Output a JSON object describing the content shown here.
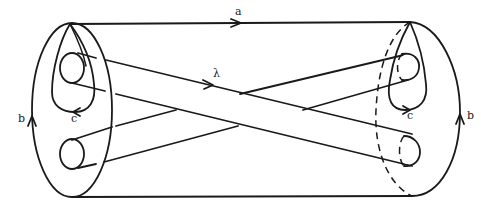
{
  "figure": {
    "labels": {
      "a": "a",
      "lambda": "λ",
      "b_left": "b",
      "c_left": "c",
      "c_right": "c",
      "b_right": "b"
    },
    "colors": {
      "ink": "#1a1a1a",
      "background": "#ffffff"
    }
  }
}
